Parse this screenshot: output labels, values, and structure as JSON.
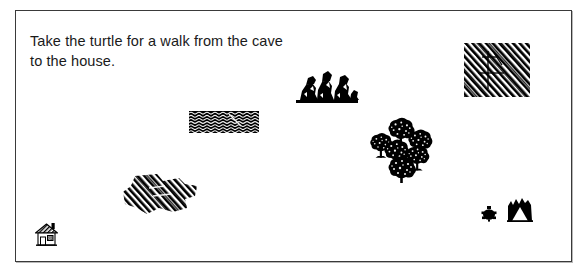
{
  "screen": {
    "width": 588,
    "height": 280,
    "background_color": "#ffffff"
  },
  "canvas": {
    "name": "turtle-walk-canvas",
    "border_color": "#3a3a3a",
    "background_color": "#ffffff"
  },
  "instruction": {
    "text": "Take the turtle for a walk from the cave\nto the house.",
    "line1": "Take the turtle for a walk from the cave",
    "line2": "to the house.",
    "color": "#1a1a1a"
  },
  "scene": {
    "ink_color": "#000000",
    "objects": [
      {
        "id": "water-patch",
        "icon": "water-pattern-icon",
        "label": "water",
        "shape": "rectangle",
        "fill_pattern": "wavy-lines",
        "x": 188,
        "y": 110,
        "width": 70,
        "height": 22
      },
      {
        "id": "terrain-rect",
        "icon": "hatched-terrain-icon",
        "label": "terrain",
        "shape": "rectangle",
        "fill_pattern": "diagonal-hatch",
        "x": 463,
        "y": 42,
        "width": 66,
        "height": 54
      },
      {
        "id": "terrain-blob",
        "icon": "hatched-terrain-icon",
        "label": "terrain",
        "shape": "irregular-blob",
        "fill_pattern": "diagonal-hatch",
        "x": 118,
        "y": 171,
        "width": 80,
        "height": 44
      },
      {
        "id": "rocks",
        "icon": "rock-cluster-icon",
        "label": "rocks",
        "shape": "cluster",
        "x": 293,
        "y": 66,
        "width": 68,
        "height": 40
      },
      {
        "id": "forest",
        "icon": "tree-cluster-icon",
        "label": "trees",
        "shape": "cluster",
        "tree_count": 6,
        "x": 368,
        "y": 112,
        "width": 68,
        "height": 70
      },
      {
        "id": "turtle",
        "icon": "turtle-icon",
        "label": "turtle",
        "x": 479,
        "y": 204,
        "width": 18,
        "height": 18
      },
      {
        "id": "cave",
        "icon": "cave-icon",
        "label": "cave",
        "x": 506,
        "y": 196,
        "width": 26,
        "height": 25
      },
      {
        "id": "house",
        "icon": "house-icon",
        "label": "house",
        "x": 33,
        "y": 219,
        "width": 26,
        "height": 28
      }
    ]
  }
}
